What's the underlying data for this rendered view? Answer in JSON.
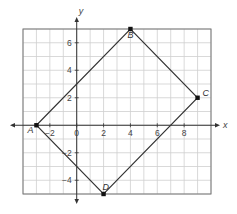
{
  "chart_data": {
    "type": "scatter",
    "title": "",
    "xlabel": "x",
    "ylabel": "y",
    "xlim": [
      -4,
      10
    ],
    "ylim": [
      -5,
      7
    ],
    "grid": true,
    "grid_step": 1,
    "x_ticks": [
      -2,
      0,
      2,
      4,
      6,
      8
    ],
    "y_ticks": [
      -4,
      -2,
      2,
      4,
      6
    ],
    "points": [
      {
        "label": "A",
        "x": -3,
        "y": 0
      },
      {
        "label": "B",
        "x": 4,
        "y": 7
      },
      {
        "label": "C",
        "x": 9,
        "y": 2
      },
      {
        "label": "D",
        "x": 2,
        "y": -5
      }
    ],
    "polygon": [
      "A",
      "B",
      "C",
      "D"
    ],
    "shape": "rectangle ABCD"
  },
  "axes": {
    "x_label": "x",
    "y_label": "y",
    "x_tick_labels": [
      "−2",
      "0",
      "2",
      "4",
      "6",
      "8"
    ],
    "y_tick_labels": [
      "6",
      "4",
      "2",
      "−2",
      "−4"
    ]
  },
  "vertices": {
    "A": "A",
    "B": "B",
    "C": "C",
    "D": "D"
  },
  "colors": {
    "grid": "#cfcfcf",
    "border": "#777777",
    "axis": "#333333",
    "polygon": "#333333",
    "point": "#111111"
  }
}
